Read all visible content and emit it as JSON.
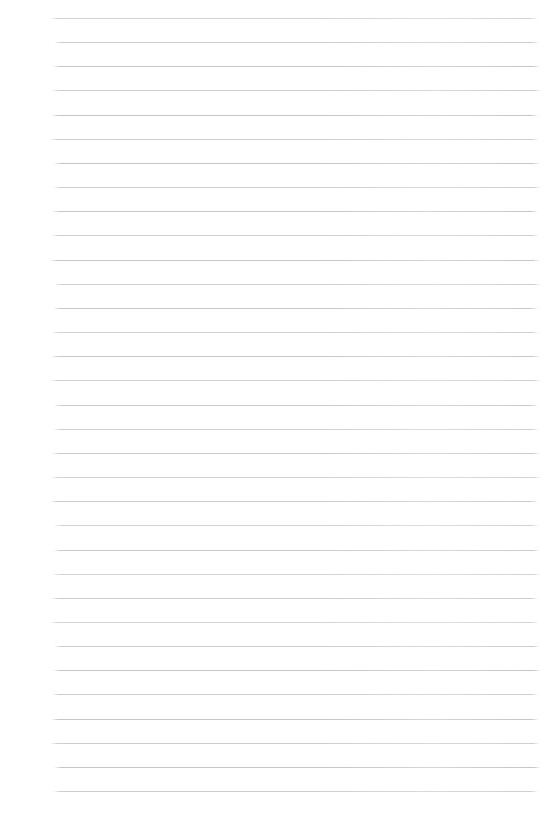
{
  "page": {
    "background_color": "#ffffff",
    "ruling": {
      "line_color": "#c3c3c3",
      "line_faint_color": "#d2d2d2",
      "line_count": 33,
      "first_line_top_px": 18,
      "line_spacing_px": 24.16,
      "line_start_x_px": 52,
      "line_end_x_px": 539,
      "line_thickness_px": 1
    }
  }
}
